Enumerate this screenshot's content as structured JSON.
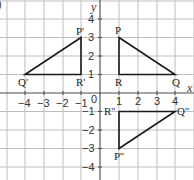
{
  "question_marker": ")",
  "axes": {
    "x_name": "x",
    "y_name": "y",
    "origin_label": "0",
    "x_ticks": [
      "−4",
      "−3",
      "−2",
      "−1",
      "1",
      "2",
      "3",
      "4"
    ],
    "y_ticks": [
      "4",
      "3",
      "2",
      "1",
      "−1",
      "−2",
      "−3",
      "−4"
    ]
  },
  "triangles": {
    "original": {
      "name": "PQR",
      "vertices": {
        "P": [
          1,
          3
        ],
        "Q": [
          4,
          1
        ],
        "R": [
          1,
          1
        ]
      },
      "labels": {
        "P": "P",
        "Q": "Q",
        "R": "R"
      }
    },
    "reflection_y": {
      "name": "P'Q'R'",
      "vertices": {
        "P'": [
          -1,
          3
        ],
        "Q'": [
          -4,
          1
        ],
        "R'": [
          -1,
          1
        ]
      },
      "labels": {
        "P": "P'",
        "Q": "Q'",
        "R": "R'"
      }
    },
    "reflection_x": {
      "name": "P''Q''R''",
      "vertices": {
        "P''": [
          1,
          -3
        ],
        "Q''": [
          4,
          -1
        ],
        "R''": [
          1,
          -1
        ]
      },
      "labels": {
        "P": "P''",
        "Q": "Q''",
        "R": "R''"
      }
    }
  },
  "colors": {
    "grid": "#bdbdbd",
    "axis": "#4a4a4a",
    "triangle": "#1a1a1a",
    "background": "#ffffff"
  }
}
